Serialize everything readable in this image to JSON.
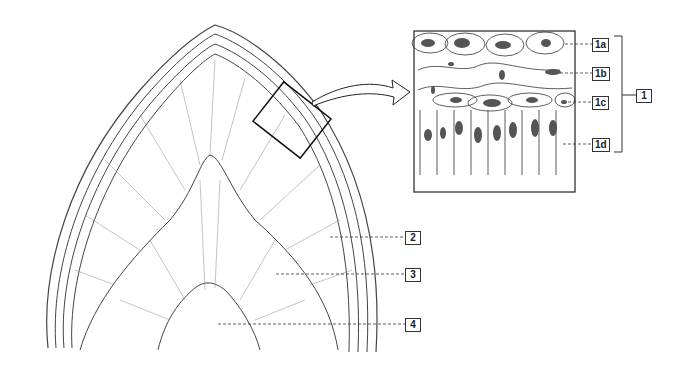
{
  "diagram": {
    "labels": [
      {
        "id": "1",
        "text": "1",
        "x": 636,
        "y": 89
      },
      {
        "id": "1a",
        "text": "1a",
        "x": 592,
        "y": 38
      },
      {
        "id": "1b",
        "text": "1b",
        "x": 592,
        "y": 67
      },
      {
        "id": "1c",
        "text": "1c",
        "x": 592,
        "y": 96
      },
      {
        "id": "1d",
        "text": "1d",
        "x": 592,
        "y": 138
      },
      {
        "id": "2",
        "text": "2",
        "x": 405,
        "y": 231
      },
      {
        "id": "3",
        "text": "3",
        "x": 405,
        "y": 268
      },
      {
        "id": "4",
        "text": "4",
        "x": 405,
        "y": 318
      }
    ],
    "colors": {
      "line": "#333333",
      "nucleus": "#555555",
      "background": "#ffffff"
    }
  }
}
